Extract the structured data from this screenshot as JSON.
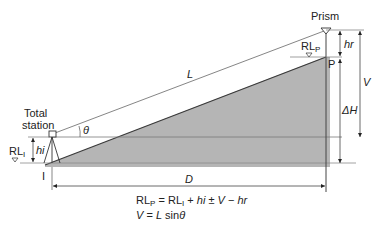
{
  "diagram": {
    "labels": {
      "total_station_line1": "Total",
      "total_station_line2": "station",
      "prism": "Prism",
      "rl_i_main": "RL",
      "rl_i_sub": "I",
      "rl_p_main": "RL",
      "rl_p_sub": "P",
      "hi": "hi",
      "hr": "hr",
      "theta": "θ",
      "L": "L",
      "P": "P",
      "I": "I",
      "V": "V",
      "delta_h": "ΔH",
      "D": "D"
    },
    "formulas": {
      "line1": {
        "lhs_main": "RL",
        "lhs_sub": "P",
        "eq": " = ",
        "rl_main": "RL",
        "rl_sub": "I",
        "plus": " + ",
        "hi": "hi",
        "pm": " ± ",
        "v": "V",
        "minus": " − ",
        "hr": "hr"
      },
      "line2": {
        "v": "V",
        "eq": " = ",
        "l": "L",
        "sin": " sin",
        "theta": "θ"
      }
    },
    "colors": {
      "ground_fill": "#b3b3b3",
      "line": "#333333",
      "light_line": "#888888"
    }
  }
}
